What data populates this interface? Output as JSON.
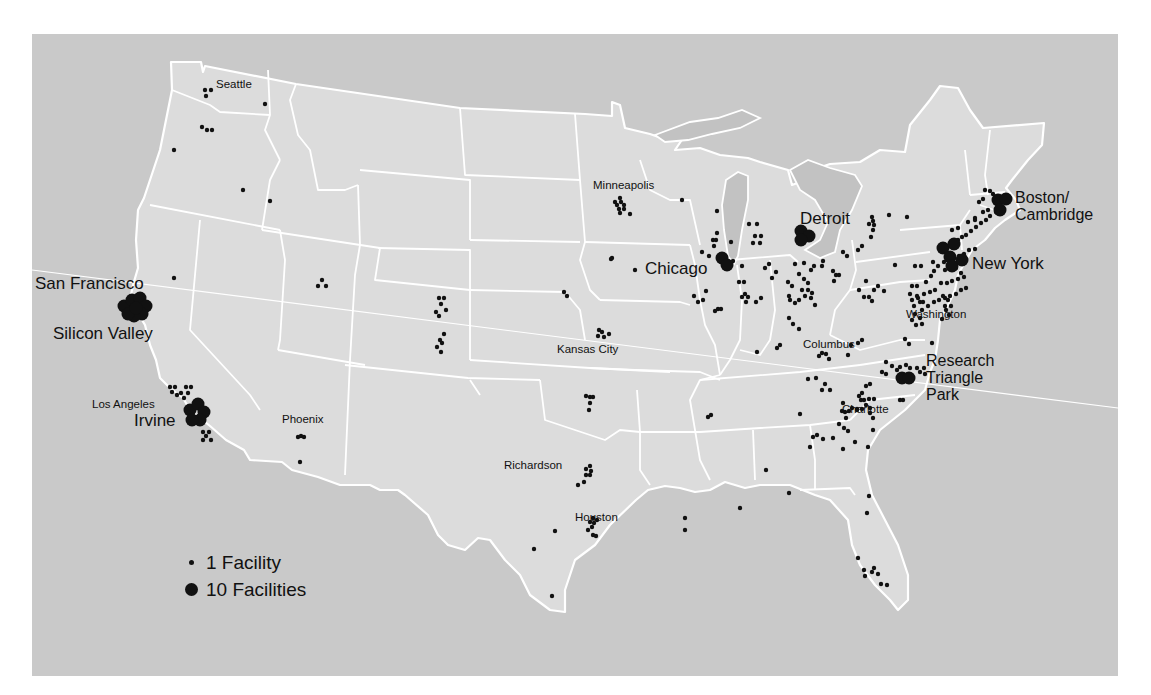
{
  "map": {
    "title": "",
    "colors": {
      "water": "#c9c9c9",
      "land": "#dcdcdc",
      "borders": "#ffffff",
      "dots": "#111111"
    }
  },
  "legend": {
    "small": {
      "label": "1 Facility",
      "icon": "small-dot-icon"
    },
    "large": {
      "label": "10 Facilities",
      "icon": "large-dot-icon"
    }
  },
  "labels": {
    "seattle": "Seattle",
    "san_francisco": "San Francisco",
    "silicon_valley": "Silicon Valley",
    "los_angeles": "Los Angeles",
    "irvine": "Irvine",
    "phoenix": "Phoenix",
    "minneapolis": "Minneapolis",
    "chicago": "Chicago",
    "detroit": "Detroit",
    "boston_1": "Boston/",
    "boston_2": "Cambridge",
    "new_york": "New York",
    "columbus": "Columbus",
    "washington": "Washington",
    "kansas_city": "Kansas City",
    "rtp_1": "Research",
    "rtp_2": "Triangle",
    "rtp_3": "Park",
    "charlotte": "Charlotte",
    "richardson": "Richardson",
    "houston": "Houston"
  },
  "chart_data": {
    "type": "scatter",
    "title": "",
    "legend": [
      "1 Facility",
      "10 Facilities"
    ],
    "small_dots": [
      [
        205,
        90
      ],
      [
        211,
        90
      ],
      [
        206,
        96
      ],
      [
        265,
        104
      ],
      [
        202,
        127
      ],
      [
        207,
        130
      ],
      [
        212,
        130
      ],
      [
        174,
        150
      ],
      [
        243,
        190
      ],
      [
        270,
        201
      ],
      [
        174,
        278
      ],
      [
        322,
        280
      ],
      [
        318,
        286
      ],
      [
        326,
        286
      ],
      [
        439,
        298
      ],
      [
        444,
        298
      ],
      [
        441,
        304
      ],
      [
        446,
        310
      ],
      [
        436,
        312
      ],
      [
        439,
        316
      ],
      [
        444,
        334
      ],
      [
        440,
        340
      ],
      [
        442,
        343
      ],
      [
        437,
        347
      ],
      [
        441,
        352
      ],
      [
        170,
        387
      ],
      [
        175,
        387
      ],
      [
        186,
        387
      ],
      [
        191,
        387
      ],
      [
        181,
        393
      ],
      [
        188,
        393
      ],
      [
        184,
        398
      ],
      [
        177,
        395
      ],
      [
        172,
        392
      ],
      [
        203,
        432
      ],
      [
        209,
        432
      ],
      [
        206,
        436
      ],
      [
        203,
        440
      ],
      [
        211,
        440
      ],
      [
        301,
        436
      ],
      [
        298,
        437
      ],
      [
        304,
        437
      ],
      [
        300,
        462
      ],
      [
        620,
        198
      ],
      [
        615,
        202
      ],
      [
        621,
        202
      ],
      [
        617,
        205
      ],
      [
        624,
        205
      ],
      [
        619,
        209
      ],
      [
        624,
        209
      ],
      [
        620,
        213
      ],
      [
        630,
        214
      ],
      [
        682,
        200
      ],
      [
        717,
        211
      ],
      [
        717,
        233
      ],
      [
        713,
        240
      ],
      [
        716,
        240
      ],
      [
        714,
        246
      ],
      [
        702,
        252
      ],
      [
        709,
        256
      ],
      [
        635,
        270
      ],
      [
        611,
        259
      ],
      [
        612,
        258
      ],
      [
        564,
        292
      ],
      [
        567,
        296
      ],
      [
        599,
        330
      ],
      [
        602,
        332
      ],
      [
        604,
        337
      ],
      [
        598,
        336
      ],
      [
        609,
        334
      ],
      [
        749,
        224
      ],
      [
        757,
        224
      ],
      [
        755,
        236
      ],
      [
        761,
        236
      ],
      [
        753,
        243
      ],
      [
        760,
        243
      ],
      [
        731,
        242
      ],
      [
        719,
        259
      ],
      [
        706,
        291
      ],
      [
        715,
        311
      ],
      [
        721,
        309
      ],
      [
        733,
        261
      ],
      [
        742,
        266
      ],
      [
        739,
        282
      ],
      [
        744,
        282
      ],
      [
        745,
        294
      ],
      [
        742,
        297
      ],
      [
        748,
        297
      ],
      [
        746,
        302
      ],
      [
        756,
        302
      ],
      [
        761,
        298
      ],
      [
        765,
        268
      ],
      [
        769,
        264
      ],
      [
        772,
        278
      ],
      [
        776,
        272
      ],
      [
        795,
        264
      ],
      [
        799,
        274
      ],
      [
        804,
        263
      ],
      [
        811,
        270
      ],
      [
        814,
        266
      ],
      [
        822,
        266
      ],
      [
        823,
        261
      ],
      [
        833,
        271
      ],
      [
        836,
        275
      ],
      [
        834,
        281
      ],
      [
        839,
        275
      ],
      [
        788,
        282
      ],
      [
        792,
        286
      ],
      [
        789,
        296
      ],
      [
        790,
        300
      ],
      [
        795,
        303
      ],
      [
        799,
        300
      ],
      [
        804,
        279
      ],
      [
        808,
        283
      ],
      [
        802,
        290
      ],
      [
        808,
        290
      ],
      [
        812,
        293
      ],
      [
        805,
        296
      ],
      [
        811,
        298
      ],
      [
        815,
        305
      ],
      [
        789,
        318
      ],
      [
        793,
        324
      ],
      [
        799,
        329
      ],
      [
        843,
        252
      ],
      [
        847,
        256
      ],
      [
        858,
        250
      ],
      [
        862,
        246
      ],
      [
        872,
        217
      ],
      [
        873,
        221
      ],
      [
        874,
        225
      ],
      [
        873,
        230
      ],
      [
        871,
        237
      ],
      [
        889,
        215
      ],
      [
        907,
        217
      ],
      [
        869,
        224
      ],
      [
        859,
        290
      ],
      [
        864,
        297
      ],
      [
        874,
        290
      ],
      [
        869,
        297
      ],
      [
        872,
        301
      ],
      [
        866,
        281
      ],
      [
        878,
        286
      ],
      [
        884,
        291
      ],
      [
        895,
        265
      ],
      [
        912,
        286
      ],
      [
        917,
        286
      ],
      [
        915,
        266
      ],
      [
        921,
        266
      ],
      [
        926,
        282
      ],
      [
        931,
        276
      ],
      [
        934,
        271
      ],
      [
        938,
        266
      ],
      [
        933,
        262
      ],
      [
        944,
        262
      ],
      [
        949,
        259
      ],
      [
        954,
        258
      ],
      [
        959,
        256
      ],
      [
        964,
        254
      ],
      [
        969,
        250
      ],
      [
        975,
        249
      ],
      [
        945,
        270
      ],
      [
        950,
        268
      ],
      [
        956,
        268
      ],
      [
        961,
        273
      ],
      [
        964,
        277
      ],
      [
        958,
        279
      ],
      [
        952,
        281
      ],
      [
        947,
        283
      ],
      [
        941,
        283
      ],
      [
        935,
        290
      ],
      [
        930,
        292
      ],
      [
        924,
        294
      ],
      [
        918,
        298
      ],
      [
        923,
        302
      ],
      [
        928,
        306
      ],
      [
        934,
        302
      ],
      [
        939,
        300
      ],
      [
        945,
        298
      ],
      [
        950,
        296
      ],
      [
        956,
        294
      ],
      [
        961,
        290
      ],
      [
        966,
        288
      ],
      [
        958,
        240
      ],
      [
        962,
        237
      ],
      [
        966,
        235
      ],
      [
        971,
        231
      ],
      [
        976,
        227
      ],
      [
        981,
        223
      ],
      [
        986,
        220
      ],
      [
        990,
        216
      ],
      [
        996,
        212
      ],
      [
        998,
        207
      ],
      [
        988,
        210
      ],
      [
        983,
        212
      ],
      [
        975,
        218
      ],
      [
        968,
        222
      ],
      [
        958,
        228
      ],
      [
        952,
        230
      ],
      [
        985,
        190
      ],
      [
        990,
        191
      ],
      [
        993,
        194
      ],
      [
        979,
        202
      ],
      [
        983,
        199
      ],
      [
        975,
        220
      ],
      [
        910,
        294
      ],
      [
        917,
        296
      ],
      [
        912,
        300
      ],
      [
        920,
        302
      ],
      [
        914,
        306
      ],
      [
        922,
        310
      ],
      [
        915,
        314
      ],
      [
        920,
        318
      ],
      [
        912,
        320
      ],
      [
        916,
        325
      ],
      [
        922,
        324
      ],
      [
        943,
        296
      ],
      [
        948,
        300
      ],
      [
        945,
        306
      ],
      [
        951,
        306
      ],
      [
        946,
        310
      ],
      [
        949,
        315
      ],
      [
        942,
        319
      ],
      [
        905,
        339
      ],
      [
        909,
        344
      ],
      [
        932,
        343
      ],
      [
        892,
        366
      ],
      [
        897,
        370
      ],
      [
        900,
        367
      ],
      [
        906,
        365
      ],
      [
        910,
        368
      ],
      [
        882,
        372
      ],
      [
        886,
        374
      ],
      [
        901,
        377
      ],
      [
        917,
        368
      ],
      [
        920,
        372
      ],
      [
        924,
        368
      ],
      [
        925,
        374
      ],
      [
        866,
        386
      ],
      [
        870,
        384
      ],
      [
        862,
        393
      ],
      [
        859,
        396
      ],
      [
        861,
        400
      ],
      [
        864,
        400
      ],
      [
        869,
        399
      ],
      [
        866,
        405
      ],
      [
        862,
        409
      ],
      [
        870,
        408
      ],
      [
        874,
        399
      ],
      [
        852,
        408
      ],
      [
        857,
        410
      ],
      [
        870,
        413
      ],
      [
        886,
        362
      ],
      [
        844,
        428
      ],
      [
        848,
        431
      ],
      [
        846,
        418
      ],
      [
        873,
        418
      ],
      [
        873,
        430
      ],
      [
        813,
        437
      ],
      [
        817,
        435
      ],
      [
        823,
        439
      ],
      [
        833,
        438
      ],
      [
        810,
        447
      ],
      [
        839,
        424
      ],
      [
        857,
        409
      ],
      [
        900,
        400
      ],
      [
        845,
        412
      ],
      [
        855,
        442
      ],
      [
        842,
        411
      ],
      [
        849,
        411
      ],
      [
        843,
        403
      ],
      [
        903,
        400
      ],
      [
        808,
        379
      ],
      [
        816,
        378
      ],
      [
        825,
        384
      ],
      [
        822,
        390
      ],
      [
        830,
        390
      ],
      [
        800,
        414
      ],
      [
        766,
        470
      ],
      [
        740,
        508
      ],
      [
        789,
        493
      ],
      [
        867,
        513
      ],
      [
        858,
        558
      ],
      [
        864,
        570
      ],
      [
        865,
        576
      ],
      [
        872,
        572
      ],
      [
        874,
        568
      ],
      [
        878,
        574
      ],
      [
        881,
        584
      ],
      [
        887,
        585
      ],
      [
        869,
        496
      ],
      [
        843,
        449
      ],
      [
        868,
        447
      ],
      [
        586,
        396
      ],
      [
        593,
        397
      ],
      [
        590,
        403
      ],
      [
        589,
        410
      ],
      [
        590,
        397
      ],
      [
        590,
        466
      ],
      [
        586,
        469
      ],
      [
        591,
        471
      ],
      [
        586,
        475
      ],
      [
        590,
        475
      ],
      [
        584,
        482
      ],
      [
        578,
        485
      ],
      [
        593,
        518
      ],
      [
        590,
        522
      ],
      [
        594,
        523
      ],
      [
        597,
        520
      ],
      [
        592,
        527
      ],
      [
        588,
        530
      ],
      [
        593,
        535
      ],
      [
        596,
        536
      ],
      [
        555,
        531
      ],
      [
        534,
        549
      ],
      [
        552,
        596
      ],
      [
        685,
        518
      ],
      [
        685,
        530
      ],
      [
        708,
        417
      ],
      [
        711,
        415
      ],
      [
        698,
        302
      ],
      [
        703,
        300
      ],
      [
        780,
        345
      ],
      [
        777,
        348
      ],
      [
        757,
        352
      ],
      [
        694,
        296
      ],
      [
        718,
        309
      ],
      [
        822,
        353
      ],
      [
        826,
        354
      ],
      [
        848,
        355
      ],
      [
        851,
        345
      ],
      [
        858,
        343
      ],
      [
        862,
        340
      ],
      [
        819,
        356
      ],
      [
        829,
        359
      ]
    ],
    "large_dots": [
      [
        124,
        306
      ],
      [
        132,
        300
      ],
      [
        140,
        298
      ],
      [
        146,
        306
      ],
      [
        142,
        314
      ],
      [
        134,
        316
      ],
      [
        128,
        314
      ],
      [
        136,
        308
      ],
      [
        190,
        410
      ],
      [
        198,
        404
      ],
      [
        204,
        412
      ],
      [
        200,
        420
      ],
      [
        192,
        420
      ],
      [
        722,
        258
      ],
      [
        727,
        265
      ],
      [
        801,
        231
      ],
      [
        809,
        236
      ],
      [
        801,
        240
      ],
      [
        943,
        248
      ],
      [
        950,
        257
      ],
      [
        952,
        266
      ],
      [
        962,
        260
      ],
      [
        954,
        244
      ],
      [
        998,
        200
      ],
      [
        1006,
        199
      ],
      [
        1000,
        210
      ],
      [
        902,
        378
      ],
      [
        909,
        378
      ]
    ]
  }
}
